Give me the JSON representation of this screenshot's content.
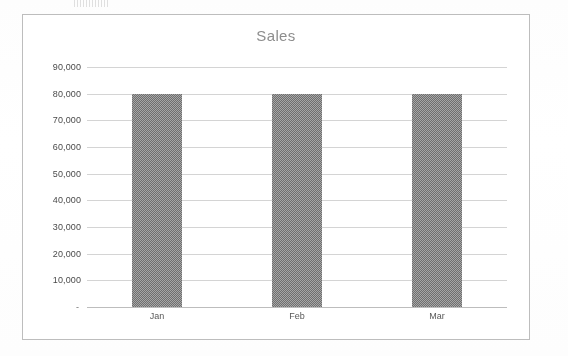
{
  "page": {
    "background_color": "#fefefe",
    "scan_remnant_present": true
  },
  "chart_frame": {
    "border_color": "#9a9a9a",
    "background_color": "#ffffff"
  },
  "chart_data": {
    "type": "bar",
    "title": "Sales",
    "subtitle": "",
    "xlabel": "",
    "ylabel": "",
    "categories": [
      "Jan",
      "Feb",
      "Mar"
    ],
    "values": [
      80000,
      80000,
      80000
    ],
    "series": [
      {
        "name": "Sales",
        "values": [
          80000,
          80000,
          80000
        ],
        "color": "#8b8b8b"
      }
    ],
    "ylim": [
      0,
      90000
    ],
    "ytick_values": [
      0,
      10000,
      20000,
      30000,
      40000,
      50000,
      60000,
      70000,
      80000,
      90000
    ],
    "ytick_labels": [
      "-",
      "10,000",
      "20,000",
      "30,000",
      "40,000",
      "50,000",
      "60,000",
      "70,000",
      "80,000",
      "90,000"
    ],
    "grid": true,
    "gridline_color": "#d2d2d2",
    "legend": false,
    "legend_position": "none",
    "title_color": "#8d8d8d",
    "tick_label_color": "#4a4a4a",
    "annotations": []
  }
}
